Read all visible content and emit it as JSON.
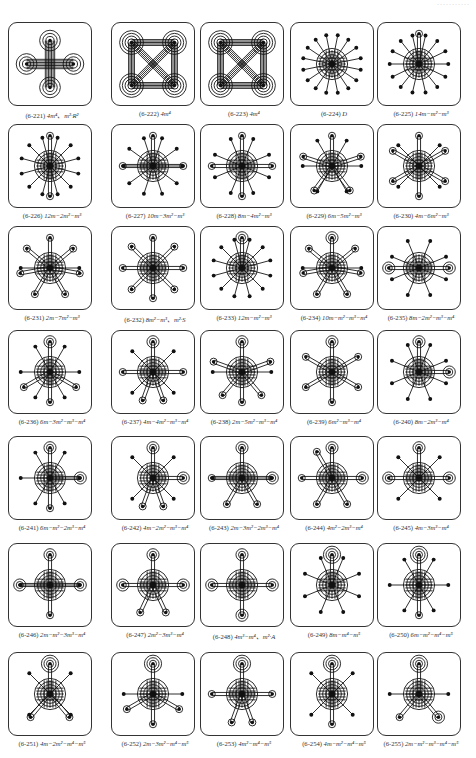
{
  "page": {
    "header": "···········"
  },
  "figures": [
    {
      "id": "6-221",
      "formula": "4m⁴、m²·R²",
      "pattern": "cross4",
      "spokes": 0,
      "ring": 3
    },
    {
      "id": "6-222",
      "formula": "4m⁴",
      "pattern": "square4",
      "spokes": 0,
      "ring": 4
    },
    {
      "id": "6-223",
      "formula": "4m⁴",
      "pattern": "square4",
      "spokes": 0,
      "ring": 4
    },
    {
      "id": "6-224",
      "formula": "D",
      "pattern": "star",
      "spokes": 16,
      "ring": 5,
      "sats": []
    },
    {
      "id": "6-225",
      "formula": "14m−m²−m³",
      "pattern": "star",
      "spokes": 14,
      "ring": 5,
      "sats": [
        [
          0,
          1
        ]
      ]
    },
    {
      "id": "6-226",
      "formula": "12m−2m²−m³",
      "pattern": "star",
      "spokes": 12,
      "ring": 5,
      "sats": [
        [
          0,
          1
        ],
        [
          180,
          1
        ]
      ]
    },
    {
      "id": "6-227",
      "formula": "10m−3m²−m³",
      "pattern": "star",
      "spokes": 10,
      "ring": 5,
      "sats": [
        [
          0,
          1
        ],
        [
          90,
          1
        ],
        [
          270,
          1
        ]
      ]
    },
    {
      "id": "6-228",
      "formula": "8m−4m²−m³",
      "pattern": "star",
      "spokes": 8,
      "ring": 5,
      "sats": [
        [
          0,
          1
        ],
        [
          90,
          1
        ],
        [
          180,
          1
        ],
        [
          270,
          1
        ]
      ]
    },
    {
      "id": "6-229",
      "formula": "6m−5m²−m³",
      "pattern": "star",
      "spokes": 6,
      "ring": 5,
      "sats": [
        [
          0,
          1
        ],
        [
          72,
          1
        ],
        [
          144,
          1
        ],
        [
          216,
          1
        ],
        [
          288,
          1
        ]
      ]
    },
    {
      "id": "6-230",
      "formula": "4m−6m²−m³",
      "pattern": "star",
      "spokes": 4,
      "ring": 5,
      "sats": [
        [
          0,
          1
        ],
        [
          60,
          1
        ],
        [
          120,
          1
        ],
        [
          180,
          1
        ],
        [
          240,
          1
        ],
        [
          300,
          1
        ]
      ]
    },
    {
      "id": "6-231",
      "formula": "2m−7m²−m³",
      "pattern": "star",
      "spokes": 2,
      "ring": 5,
      "sats": [
        [
          0,
          1
        ],
        [
          50,
          1
        ],
        [
          100,
          1
        ],
        [
          150,
          1
        ],
        [
          210,
          1
        ],
        [
          260,
          1
        ],
        [
          310,
          1
        ]
      ]
    },
    {
      "id": "6-232",
      "formula": "8m²−m³、m²·S",
      "pattern": "star",
      "spokes": 0,
      "ring": 5,
      "sats": [
        [
          0,
          1
        ],
        [
          45,
          1
        ],
        [
          90,
          1
        ],
        [
          135,
          1
        ],
        [
          180,
          1
        ],
        [
          225,
          1
        ],
        [
          270,
          1
        ],
        [
          315,
          1
        ]
      ]
    },
    {
      "id": "6-233",
      "formula": "12m−m²−m³",
      "pattern": "star",
      "spokes": 12,
      "ring": 5,
      "sats": [
        [
          0,
          2
        ]
      ]
    },
    {
      "id": "6-234",
      "formula": "10m−m²−m³−m⁴",
      "pattern": "star",
      "spokes": 2,
      "ring": 5,
      "sats": [
        [
          0,
          2
        ],
        [
          50,
          1
        ],
        [
          100,
          0
        ],
        [
          150,
          1
        ],
        [
          210,
          1
        ],
        [
          260,
          0
        ],
        [
          310,
          1
        ]
      ]
    },
    {
      "id": "6-235",
      "formula": "8m−2m²−m³−m⁴",
      "pattern": "star",
      "spokes": 8,
      "ring": 5,
      "sats": [
        [
          90,
          2
        ],
        [
          270,
          2
        ]
      ]
    },
    {
      "id": "6-236",
      "formula": "6m−3m²−m³−m⁴",
      "pattern": "star",
      "spokes": 6,
      "ring": 5,
      "sats": [
        [
          0,
          2
        ],
        [
          120,
          1
        ],
        [
          180,
          1
        ],
        [
          240,
          1
        ]
      ]
    },
    {
      "id": "6-237",
      "formula": "4m−4m²−m³−m⁴",
      "pattern": "star",
      "spokes": 4,
      "ring": 5,
      "sats": [
        [
          0,
          2
        ],
        [
          90,
          1
        ],
        [
          160,
          1
        ],
        [
          200,
          1
        ],
        [
          270,
          1
        ]
      ]
    },
    {
      "id": "6-238",
      "formula": "2m−5m²−m³−m⁴",
      "pattern": "star",
      "spokes": 2,
      "ring": 5,
      "sats": [
        [
          0,
          2
        ],
        [
          70,
          1
        ],
        [
          140,
          1
        ],
        [
          180,
          1
        ],
        [
          220,
          1
        ],
        [
          290,
          1
        ]
      ]
    },
    {
      "id": "6-239",
      "formula": "6m²−m³−m⁴",
      "pattern": "star",
      "spokes": 0,
      "ring": 5,
      "sats": [
        [
          0,
          2
        ],
        [
          60,
          1
        ],
        [
          120,
          1
        ],
        [
          180,
          1
        ],
        [
          240,
          1
        ],
        [
          300,
          1
        ]
      ]
    },
    {
      "id": "6-240",
      "formula": "8m−2m³−m⁴",
      "pattern": "star",
      "spokes": 8,
      "ring": 5,
      "sats": [
        [
          0,
          2
        ],
        [
          90,
          2
        ]
      ]
    },
    {
      "id": "6-241",
      "formula": "6m−m²−2m³−m⁴",
      "pattern": "star",
      "spokes": 6,
      "ring": 5,
      "sats": [
        [
          0,
          2
        ],
        [
          90,
          2
        ],
        [
          180,
          1
        ]
      ]
    },
    {
      "id": "6-242",
      "formula": "4m−2m²−m³−m⁴",
      "pattern": "star",
      "spokes": 4,
      "ring": 5,
      "sats": [
        [
          0,
          2
        ],
        [
          90,
          2
        ],
        [
          160,
          1
        ],
        [
          200,
          1
        ]
      ]
    },
    {
      "id": "6-243",
      "formula": "2m−3m²−2m³−m⁴",
      "pattern": "star",
      "spokes": 2,
      "ring": 5,
      "sats": [
        [
          0,
          2
        ],
        [
          90,
          2
        ],
        [
          150,
          1
        ],
        [
          210,
          1
        ],
        [
          270,
          1
        ]
      ]
    },
    {
      "id": "6-244",
      "formula": "4m²−2m³−m⁴",
      "pattern": "star",
      "spokes": 0,
      "ring": 5,
      "sats": [
        [
          0,
          2
        ],
        [
          90,
          2
        ],
        [
          150,
          1
        ],
        [
          210,
          1
        ],
        [
          270,
          1
        ],
        [
          330,
          1
        ]
      ]
    },
    {
      "id": "6-245",
      "formula": "4m−3m³−m⁴",
      "pattern": "star",
      "spokes": 4,
      "ring": 5,
      "sats": [
        [
          0,
          2
        ],
        [
          90,
          2
        ],
        [
          270,
          2
        ]
      ]
    },
    {
      "id": "6-246",
      "formula": "2m−m²−3m³−m⁴",
      "pattern": "star",
      "spokes": 2,
      "ring": 5,
      "sats": [
        [
          0,
          2
        ],
        [
          90,
          2
        ],
        [
          270,
          2
        ],
        [
          180,
          1
        ]
      ]
    },
    {
      "id": "6-247",
      "formula": "2m²−3m³−m⁴",
      "pattern": "star",
      "spokes": 0,
      "ring": 5,
      "sats": [
        [
          0,
          2
        ],
        [
          90,
          2
        ],
        [
          270,
          2
        ],
        [
          155,
          1
        ],
        [
          205,
          1
        ]
      ]
    },
    {
      "id": "6-248",
      "formula": "4m³−m⁴、m²·A",
      "pattern": "star",
      "spokes": 0,
      "ring": 5,
      "sats": [
        [
          0,
          2
        ],
        [
          90,
          2
        ],
        [
          180,
          2
        ],
        [
          270,
          2
        ]
      ]
    },
    {
      "id": "6-249",
      "formula": "8m−m⁴−m⁵",
      "pattern": "star",
      "spokes": 8,
      "ring": 5,
      "sats": [
        [
          0,
          3
        ]
      ]
    },
    {
      "id": "6-250",
      "formula": "6m−m²−m⁴−m⁵",
      "pattern": "star",
      "spokes": 6,
      "ring": 5,
      "sats": [
        [
          0,
          3
        ],
        [
          180,
          1
        ]
      ]
    },
    {
      "id": "6-251",
      "formula": "4m−2m²−m⁴−m⁵",
      "pattern": "star",
      "spokes": 4,
      "ring": 5,
      "sats": [
        [
          0,
          3
        ],
        [
          140,
          1
        ],
        [
          220,
          1
        ]
      ]
    },
    {
      "id": "6-252",
      "formula": "2m−3m²−m⁴−m⁵",
      "pattern": "star",
      "spokes": 2,
      "ring": 5,
      "sats": [
        [
          0,
          3
        ],
        [
          120,
          1
        ],
        [
          180,
          1
        ],
        [
          240,
          1
        ]
      ]
    },
    {
      "id": "6-253",
      "formula": "4m²−m⁴−m⁵",
      "pattern": "star",
      "spokes": 0,
      "ring": 5,
      "sats": [
        [
          0,
          3
        ],
        [
          90,
          1
        ],
        [
          160,
          1
        ],
        [
          200,
          1
        ],
        [
          270,
          1
        ]
      ]
    },
    {
      "id": "6-254",
      "formula": "4m−m²−m⁴−m⁵",
      "pattern": "star",
      "spokes": 4,
      "ring": 5,
      "sats": [
        [
          0,
          3
        ],
        [
          180,
          1
        ]
      ]
    },
    {
      "id": "6-255",
      "formula": "2m−m²−m³−m⁴−m⁵",
      "pattern": "star",
      "spokes": 2,
      "ring": 5,
      "sats": [
        [
          0,
          3
        ],
        [
          140,
          2
        ],
        [
          220,
          1
        ]
      ]
    }
  ],
  "layout": {
    "cols_x": [
      8,
      111,
      200,
      290,
      377
    ],
    "rows_y": [
      22,
      124,
      226,
      330,
      436,
      543,
      652
    ],
    "cap_offset": 88
  }
}
